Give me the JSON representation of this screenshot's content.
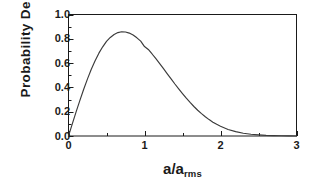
{
  "chart_data": {
    "type": "line",
    "title": "",
    "xlabel": "a/a_rms",
    "xlabel_base": "a/a",
    "xlabel_subscript": "rms",
    "ylabel": "Probability Density",
    "xlim": [
      0,
      3
    ],
    "ylim": [
      0,
      1.0
    ],
    "grid": false,
    "legend": null,
    "line_color": "#3a3a3a",
    "axis_color": "#1a1a1a",
    "background_color": "#ffffff",
    "xticks": [
      {
        "value": 0,
        "label": "0"
      },
      {
        "value": 1,
        "label": "1"
      },
      {
        "value": 2,
        "label": "2"
      },
      {
        "value": 3,
        "label": "3"
      }
    ],
    "xticks_minor": [
      0.5,
      1.5,
      2.5
    ],
    "yticks": [
      {
        "value": 0.0,
        "label": "0.0"
      },
      {
        "value": 0.2,
        "label": "0.2"
      },
      {
        "value": 0.4,
        "label": "0.4"
      },
      {
        "value": 0.6,
        "label": "0.6"
      },
      {
        "value": 0.8,
        "label": "0.8"
      },
      {
        "value": 1.0,
        "label": "1.0"
      }
    ],
    "yticks_minor": [
      0.1,
      0.3,
      0.5,
      0.7,
      0.9
    ],
    "peak": {
      "x": 0.707,
      "y": 0.858
    },
    "series": [
      {
        "name": "Rayleigh probability density",
        "x": [
          0.0,
          0.05,
          0.1,
          0.15,
          0.2,
          0.25,
          0.3,
          0.35,
          0.4,
          0.45,
          0.5,
          0.55,
          0.6,
          0.65,
          0.7,
          0.75,
          0.8,
          0.85,
          0.9,
          0.95,
          1.0,
          1.05,
          1.1,
          1.15,
          1.2,
          1.25,
          1.3,
          1.35,
          1.4,
          1.45,
          1.5,
          1.55,
          1.6,
          1.65,
          1.7,
          1.75,
          1.8,
          1.85,
          1.9,
          1.95,
          2.0,
          2.1,
          2.2,
          2.3,
          2.4,
          2.5,
          2.6,
          2.7,
          2.8,
          2.9,
          3.0
        ],
        "y": [
          0.0,
          0.1,
          0.198,
          0.293,
          0.385,
          0.47,
          0.549,
          0.62,
          0.682,
          0.734,
          0.779,
          0.811,
          0.836,
          0.851,
          0.858,
          0.856,
          0.847,
          0.831,
          0.808,
          0.781,
          0.736,
          0.712,
          0.675,
          0.636,
          0.596,
          0.554,
          0.512,
          0.47,
          0.428,
          0.388,
          0.349,
          0.311,
          0.276,
          0.243,
          0.212,
          0.184,
          0.158,
          0.135,
          0.114,
          0.096,
          0.08,
          0.054,
          0.036,
          0.023,
          0.014,
          0.009,
          0.005,
          0.003,
          0.002,
          0.001,
          0.0
        ]
      }
    ]
  }
}
